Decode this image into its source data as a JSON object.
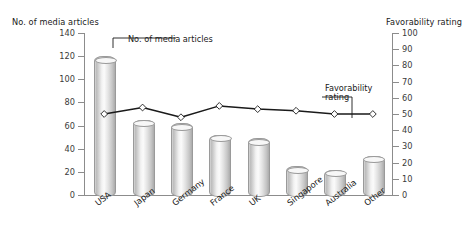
{
  "chart_data": {
    "type": "bar",
    "title": "",
    "categories": [
      "USA",
      "Japan",
      "Germany",
      "France",
      "UK",
      "Singapore",
      "Australia",
      "Other"
    ],
    "xlabel": "",
    "grid": false,
    "legend_position": "inline-callouts",
    "axes": {
      "left": {
        "label": "No. of media articles",
        "min": 0,
        "max": 140,
        "step": 20,
        "ticks": [
          "0",
          "20",
          "40",
          "60",
          "80",
          "100",
          "120",
          "140"
        ]
      },
      "right": {
        "label": "Favorability rating",
        "min": 0,
        "max": 100,
        "step": 10,
        "ticks": [
          "0",
          "10",
          "20",
          "30",
          "40",
          "50",
          "60",
          "70",
          "80",
          "90",
          "100"
        ]
      }
    },
    "series": [
      {
        "name": "No. of media articles",
        "type": "bar",
        "axis": "left",
        "values": [
          120,
          65,
          62,
          52,
          49,
          25,
          22,
          34
        ]
      },
      {
        "name": "Favorability rating",
        "type": "line",
        "axis": "right",
        "values": [
          50,
          54,
          48,
          55,
          53,
          52,
          50,
          50
        ]
      }
    ],
    "annotations": [
      {
        "name": "bars-callout",
        "text": "No. of media articles"
      },
      {
        "name": "line-callout",
        "text_line1": "Favorability",
        "text_line2": "rating"
      }
    ],
    "colors": {
      "bar_fill": "#e3e3e3",
      "bar_edge": "#9a9a9a",
      "line": "#1a1a1a",
      "marker": "#ffffff",
      "axis": "#8c8c8c",
      "text": "#1a1a1a"
    }
  },
  "axis_titles": {
    "left": "No. of media articles",
    "right": "Favorability rating"
  },
  "callouts": {
    "bars": "No. of media articles",
    "line_1": "Favorability",
    "line_2": "rating"
  }
}
